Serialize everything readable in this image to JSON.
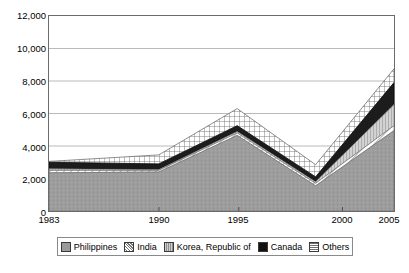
{
  "chart_data": {
    "type": "area",
    "title": "",
    "subtitle": "",
    "xlabel": "",
    "ylabel": "",
    "stacked": true,
    "grid": true,
    "legend_position": "bottom",
    "categories": [
      "1983",
      "1990",
      "1995",
      "2000",
      "2005"
    ],
    "x": [
      1983,
      1990,
      1995,
      2000,
      2005
    ],
    "xlim": [
      1983,
      2005
    ],
    "ylim": [
      0,
      12000
    ],
    "yticks": [
      0,
      2000,
      4000,
      6000,
      8000,
      10000,
      12000
    ],
    "ytick_labels": [
      "0",
      "2,000",
      "4,000",
      "6,000",
      "8,000",
      "10,000",
      "12,000"
    ],
    "xtick_labels": [
      "1983",
      "1990",
      "1995",
      "2000",
      "2005"
    ],
    "series": [
      {
        "name": "Philippines",
        "values": [
          2350,
          2400,
          4650,
          1550,
          4950
        ]
      },
      {
        "name": "India",
        "values": [
          2500,
          2500,
          4800,
          1700,
          5250
        ]
      },
      {
        "name": "Korea, Republic of",
        "values": [
          2600,
          2550,
          4900,
          1800,
          6550
        ]
      },
      {
        "name": "Canada",
        "values": [
          3000,
          2900,
          5250,
          2100,
          7900
        ]
      },
      {
        "name": "Others",
        "values": [
          3050,
          3450,
          6300,
          2850,
          8750
        ]
      }
    ],
    "cumulative_top": [
      4200,
      5600,
      7900,
      4050,
      11200
    ],
    "series_order_bottom_to_top": [
      "Philippines",
      "India",
      "Korea, Republic of",
      "Canada",
      "Others"
    ],
    "fill_patterns": {
      "Philippines": "solid-gray",
      "India": "diagonal-hatch",
      "Korea, Republic of": "vertical-lines",
      "Canada": "solid-black",
      "Others": "crosshatch-grid"
    },
    "colors": {
      "Philippines": "#9a9a9a",
      "India": "#ffffff",
      "Korea, Republic of": "#c9c9c9",
      "Canada": "#1a1a1a",
      "Others": "#ffffff",
      "grid": "#a8a8a8",
      "frame": "#6b6b6b",
      "text": "#000000"
    }
  },
  "legend": {
    "items": [
      {
        "label": "Philippines",
        "icon": "legend-swatch-philippines"
      },
      {
        "label": "India",
        "icon": "legend-swatch-india"
      },
      {
        "label": "Korea, Republic of",
        "icon": "legend-swatch-korea"
      },
      {
        "label": "Canada",
        "icon": "legend-swatch-canada"
      },
      {
        "label": "Others",
        "icon": "legend-swatch-others"
      }
    ]
  }
}
